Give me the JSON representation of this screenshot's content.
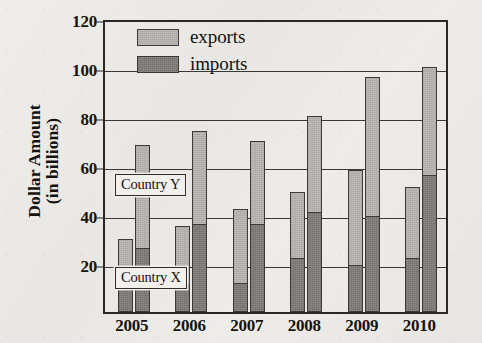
{
  "chart_data": {
    "type": "bar",
    "title": "",
    "subtitle": "",
    "xlabel": "",
    "ylabel": "Dollar Amount (in billions)",
    "ylabel_line1": "Dollar Amount",
    "ylabel_line2": "(in billions)",
    "categories": [
      "2005",
      "2006",
      "2007",
      "2008",
      "2009",
      "2010"
    ],
    "ylim": [
      0,
      120
    ],
    "ytick_values": [
      20,
      40,
      60,
      80,
      100,
      120
    ],
    "ytick_labels": [
      "20",
      "40",
      "60",
      "80",
      "100",
      "120"
    ],
    "grid": true,
    "grid_axis": "y",
    "legend_position": "top-left-inside",
    "stacked": true,
    "groups_per_category": 2,
    "group_labels": [
      "Country X",
      "Country Y"
    ],
    "legend": [
      {
        "name": "exports",
        "color": "#b2b0ad"
      },
      {
        "name": "imports",
        "color": "#7e7c79"
      }
    ],
    "series": [
      {
        "name": "Country X",
        "totals": [
          30,
          35,
          42,
          49,
          58,
          51
        ],
        "imports": [
          10,
          11,
          12,
          22,
          19,
          22
        ],
        "exports": [
          20,
          24,
          30,
          27,
          39,
          29
        ]
      },
      {
        "name": "Country Y",
        "totals": [
          68,
          74,
          70,
          80,
          96,
          100
        ],
        "imports": [
          26,
          36,
          36,
          41,
          39,
          56
        ],
        "exports": [
          42,
          38,
          34,
          39,
          57,
          44
        ]
      }
    ],
    "annotations": [
      {
        "text": "Country Y",
        "points_to": "upper light segment of taller bar"
      },
      {
        "text": "Country X",
        "points_to": "lower shorter bar of each pair"
      }
    ]
  },
  "colors": {
    "exports": "#b2b0ad",
    "imports": "#7e7c79",
    "axis": "#2a2724",
    "grid": "#3a3734",
    "text": "#14120f",
    "background": "#eceae6"
  }
}
